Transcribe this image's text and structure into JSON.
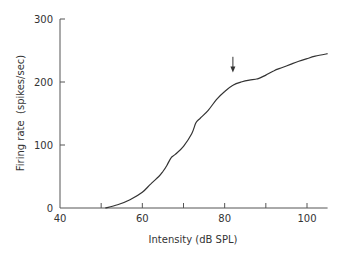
{
  "chart_data": {
    "type": "line",
    "title": "",
    "xlabel": "Intensity (dB SPL)",
    "ylabel": "Firing rate  (spikes/sec)",
    "xlim": [
      40,
      105
    ],
    "ylim": [
      0,
      300
    ],
    "xticks": [
      40,
      50,
      60,
      70,
      80,
      90,
      100
    ],
    "xtick_labels": [
      "40",
      "",
      "60",
      "",
      "80",
      "",
      "100"
    ],
    "yticks": [
      0,
      100,
      200,
      300
    ],
    "ytick_labels": [
      "0",
      "100",
      "200",
      "300"
    ],
    "grid": false,
    "legend": null,
    "series": [
      {
        "name": "firing rate",
        "x": [
          51,
          54,
          57,
          60,
          62,
          64,
          65,
          66,
          67,
          68,
          70,
          72,
          73,
          74,
          76,
          78,
          80,
          82,
          84,
          86,
          88,
          90,
          92,
          94,
          96,
          98,
          100,
          102,
          105
        ],
        "y": [
          0,
          5,
          13,
          25,
          38,
          50,
          58,
          68,
          80,
          85,
          98,
          118,
          135,
          142,
          155,
          172,
          185,
          195,
          200,
          203,
          205,
          211,
          218,
          223,
          228,
          233,
          237,
          241,
          245
        ]
      }
    ],
    "annotations": [
      {
        "type": "arrow",
        "x": 82,
        "direction": "down",
        "y_from": 240,
        "y_to": 215
      }
    ]
  }
}
